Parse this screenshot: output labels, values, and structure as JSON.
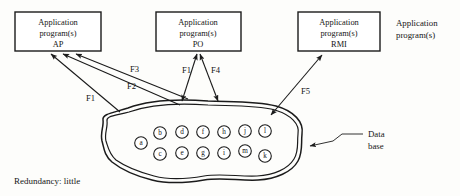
{
  "diagram": {
    "title_note": "Redundancy: little",
    "side_annotation": {
      "line1": "Application",
      "line2": "program(s)"
    },
    "database_annotation": {
      "line1": "Data",
      "line2": "base"
    },
    "program_boxes": [
      {
        "id": "ap",
        "line1": "Application",
        "line2": "program(s)",
        "line3": "AP"
      },
      {
        "id": "po",
        "line1": "Application",
        "line2": "program(s)",
        "line3": "PO"
      },
      {
        "id": "rmi",
        "line1": "Application",
        "line2": "program(s)",
        "line3": "RMI"
      }
    ],
    "flows": [
      {
        "id": "f1a",
        "label": "F1",
        "from": "database",
        "to": "AP",
        "arrow": "single"
      },
      {
        "id": "f2",
        "label": "F2",
        "from": "database",
        "to": "AP",
        "arrow": "single"
      },
      {
        "id": "f3",
        "label": "F3",
        "from": "database",
        "to": "AP",
        "arrow": "single"
      },
      {
        "id": "f1b",
        "label": "F1",
        "from": "PO",
        "to": "database",
        "arrow": "double"
      },
      {
        "id": "f4",
        "label": "F4",
        "from": "PO",
        "to": "database",
        "arrow": "double"
      },
      {
        "id": "f5",
        "label": "F5",
        "from": "database",
        "to": "RMI",
        "arrow": "double"
      }
    ],
    "database_nodes": [
      {
        "letter": "a",
        "cx": 141,
        "cy": 143
      },
      {
        "letter": "b",
        "cx": 160,
        "cy": 133
      },
      {
        "letter": "c",
        "cx": 160,
        "cy": 154
      },
      {
        "letter": "d",
        "cx": 182,
        "cy": 132
      },
      {
        "letter": "e",
        "cx": 182,
        "cy": 153
      },
      {
        "letter": "f",
        "cx": 203,
        "cy": 132
      },
      {
        "letter": "g",
        "cx": 203,
        "cy": 153
      },
      {
        "letter": "h",
        "cx": 224,
        "cy": 132
      },
      {
        "letter": "i",
        "cx": 224,
        "cy": 153
      },
      {
        "letter": "j",
        "cx": 245,
        "cy": 131
      },
      {
        "letter": "m",
        "cx": 245,
        "cy": 151
      },
      {
        "letter": "l",
        "cx": 265,
        "cy": 131
      },
      {
        "letter": "k",
        "cx": 265,
        "cy": 156
      }
    ]
  }
}
